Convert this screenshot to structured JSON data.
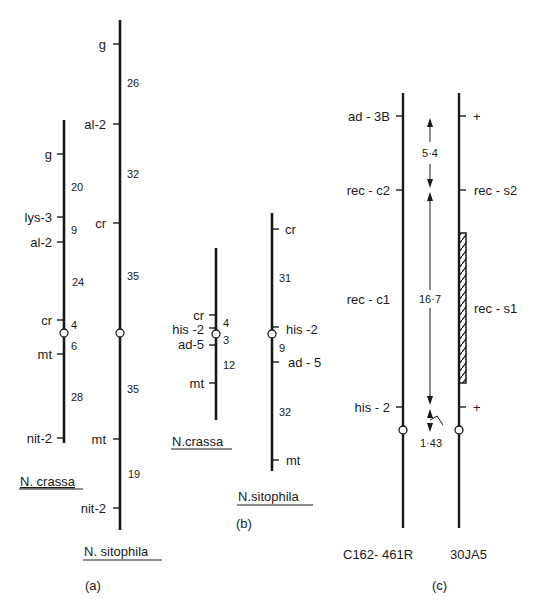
{
  "figure": {
    "panels": [
      {
        "id": "a",
        "caption": "(a)",
        "maps": [
          {
            "species": "N. crassa",
            "loci": [
              "g",
              "lys-3",
              "al-2",
              "cr",
              "mt",
              "nit-2"
            ],
            "distances": [
              "20",
              "9",
              "24",
              "4",
              "6",
              "28"
            ],
            "centromere_between": [
              "cr",
              "mt"
            ]
          },
          {
            "species": "N. sitophila",
            "loci": [
              "g",
              "al-2",
              "cr",
              "mt",
              "nit-2"
            ],
            "distances": [
              "26",
              "32",
              "35",
              "35",
              "19"
            ],
            "centromere_between": [
              "cr",
              "mt"
            ]
          }
        ]
      },
      {
        "id": "b",
        "caption": "(b)",
        "maps": [
          {
            "species": "N.crassa",
            "loci": [
              "cr",
              "his-2",
              "ad-5",
              "mt"
            ],
            "distances": [
              "4",
              "3",
              "12"
            ]
          },
          {
            "species": "N.sitophila",
            "loci": [
              "cr",
              "his-2",
              "ad-5",
              "mt"
            ],
            "distances": [
              "31",
              "9",
              "32"
            ]
          }
        ]
      },
      {
        "id": "c",
        "caption": "(c)",
        "strains": [
          "C162-461R",
          "30JA5"
        ],
        "left_loci": [
          "ad-3B",
          "rec-c2",
          "rec-c1",
          "his-2"
        ],
        "right_loci": [
          "+",
          "rec-s2",
          "rec-s1",
          "+"
        ],
        "distances": [
          "5·4",
          "16·7",
          "1·43"
        ]
      }
    ]
  },
  "a": {
    "crassa": {
      "g": "g",
      "lys3": "lys-3",
      "al2": "al-2",
      "cr": "cr",
      "mt": "mt",
      "nit2": "nit-2",
      "d1": "20",
      "d2": "9",
      "d3": "24",
      "d4": "4",
      "d5": "6",
      "d6": "28",
      "name": "N. crassa"
    },
    "sitophila": {
      "g": "g",
      "al2": "al-2",
      "cr": "cr",
      "mt": "mt",
      "nit2": "nit-2",
      "d1": "26",
      "d2": "32",
      "d3": "35",
      "d4": "35",
      "d5": "19",
      "name": "N. sitophila"
    },
    "caption": "(a)"
  },
  "b": {
    "crassa": {
      "cr": "cr",
      "his2": "his -2",
      "ad5": "ad-5",
      "mt": "mt",
      "d1": "4",
      "d2": "3",
      "d3": "12",
      "name": "N.crassa"
    },
    "sitophila": {
      "cr": "cr",
      "his2": "his -2",
      "ad5": "ad - 5",
      "mt": "mt",
      "d1": "31",
      "d2": "9",
      "d3": "32",
      "name": "N.sitophila"
    },
    "caption": "(b)"
  },
  "c": {
    "left": {
      "ad3b": "ad - 3B",
      "recc2": "rec - c2",
      "recc1": "rec - c1",
      "his2": "his - 2",
      "strain": "C162- 461R"
    },
    "right": {
      "plus1": "+",
      "recs2": "rec - s2",
      "recs1": "rec - s1",
      "plus2": "+",
      "strain": "30JA5"
    },
    "d1": "5·4",
    "d2": "16·7",
    "d3": "1·43",
    "caption": "(c)"
  }
}
